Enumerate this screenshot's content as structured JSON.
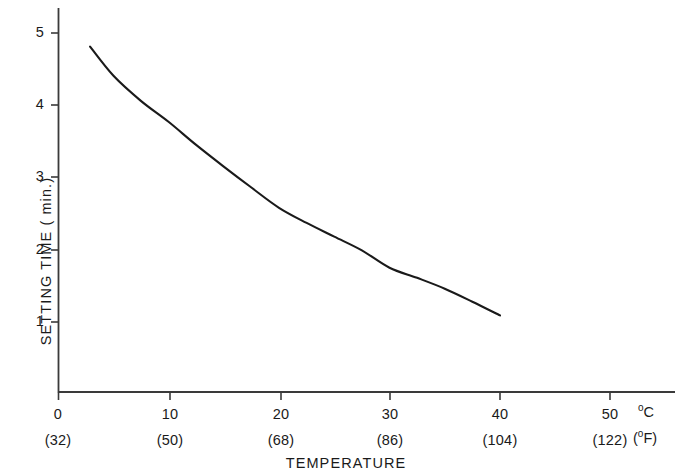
{
  "chart_data": {
    "type": "line",
    "title": "",
    "xlabel": "TEMPERATURE",
    "ylabel": "SETTING TIME ( min.)",
    "xlim": [
      0,
      55.8
    ],
    "ylim": [
      0,
      5.3
    ],
    "grid": false,
    "legend": null,
    "x_unit_primary": "°C",
    "x_unit_secondary": "(°F)",
    "x_ticks": [
      {
        "celsius": "0",
        "fahrenheit": "(32)",
        "value": 0
      },
      {
        "celsius": "10",
        "fahrenheit": "(50)",
        "value": 10
      },
      {
        "celsius": "20",
        "fahrenheit": "(68)",
        "value": 20
      },
      {
        "celsius": "30",
        "fahrenheit": "(86)",
        "value": 30
      },
      {
        "celsius": "40",
        "fahrenheit": "(104)",
        "value": 40
      },
      {
        "celsius": "50",
        "fahrenheit": "(122)",
        "value": 50
      }
    ],
    "y_ticks": [
      {
        "label": "1",
        "value": 1
      },
      {
        "label": "2",
        "value": 2
      },
      {
        "label": "3",
        "value": 3
      },
      {
        "label": "4",
        "value": 4
      },
      {
        "label": "5",
        "value": 5
      }
    ],
    "series": [
      {
        "name": "setting time vs temperature",
        "color": "#1a1a1a",
        "x": [
          2.9,
          5,
          7.5,
          10,
          12.5,
          15,
          17.5,
          20,
          22.5,
          25,
          27.5,
          30,
          32.5,
          35,
          37.5,
          40
        ],
        "values": [
          4.78,
          4.38,
          4.03,
          3.74,
          3.42,
          3.12,
          2.83,
          2.55,
          2.34,
          2.15,
          1.96,
          1.72,
          1.58,
          1.43,
          1.25,
          1.06
        ]
      }
    ]
  },
  "axis_geometry": {
    "plot_left": 58,
    "plot_right": 675,
    "plot_top": 8,
    "plot_bottom": 392,
    "px_per_celsius": 11.05,
    "px_per_minute": 72.25
  },
  "colors": {
    "background": "#ffffff",
    "axis": "#3a3a3a",
    "curve": "#1a1a1a",
    "text": "#1a1a1a"
  }
}
